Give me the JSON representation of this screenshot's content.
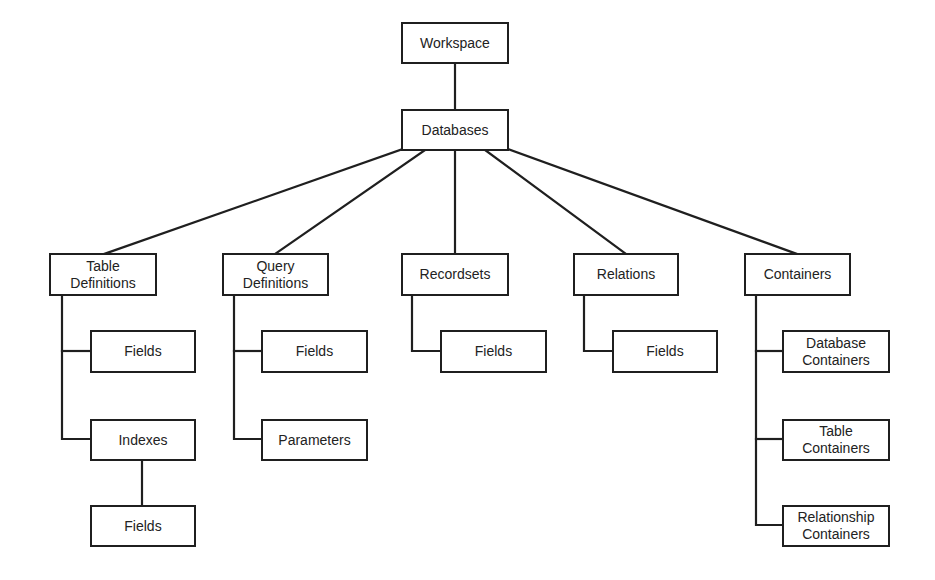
{
  "diagram": {
    "type": "hierarchy",
    "line_color": "#1f1f1f",
    "nodes": {
      "workspace": "Workspace",
      "databases": "Databases",
      "table_definitions": "Table\nDefinitions",
      "td_fields": "Fields",
      "td_indexes": "Indexes",
      "idx_fields": "Fields",
      "query_definitions": "Query\nDefinitions",
      "qd_fields": "Fields",
      "qd_parameters": "Parameters",
      "recordsets": "Recordsets",
      "rs_fields": "Fields",
      "relations": "Relations",
      "rel_fields": "Fields",
      "containers": "Containers",
      "database_containers": "Database\nContainers",
      "table_containers": "Table\nContainers",
      "relationship_containers": "Relationship\nContainers"
    },
    "edges": [
      [
        "workspace",
        "databases"
      ],
      [
        "databases",
        "table_definitions"
      ],
      [
        "databases",
        "query_definitions"
      ],
      [
        "databases",
        "recordsets"
      ],
      [
        "databases",
        "relations"
      ],
      [
        "databases",
        "containers"
      ],
      [
        "table_definitions",
        "td_fields"
      ],
      [
        "table_definitions",
        "td_indexes"
      ],
      [
        "td_indexes",
        "idx_fields"
      ],
      [
        "query_definitions",
        "qd_fields"
      ],
      [
        "query_definitions",
        "qd_parameters"
      ],
      [
        "recordsets",
        "rs_fields"
      ],
      [
        "relations",
        "rel_fields"
      ],
      [
        "containers",
        "database_containers"
      ],
      [
        "containers",
        "table_containers"
      ],
      [
        "containers",
        "relationship_containers"
      ]
    ]
  }
}
